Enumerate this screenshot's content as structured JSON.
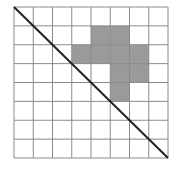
{
  "grid": {
    "rows": 8,
    "cols": 8,
    "left": 14,
    "top": 7,
    "width": 154,
    "height": 151,
    "line_color": "#8a8a8a",
    "shade_color": "#9a9a9a",
    "shaded_cells": [
      {
        "row": 1,
        "col": 4
      },
      {
        "row": 1,
        "col": 5
      },
      {
        "row": 2,
        "col": 3
      },
      {
        "row": 2,
        "col": 4
      },
      {
        "row": 2,
        "col": 5
      },
      {
        "row": 2,
        "col": 6
      },
      {
        "row": 3,
        "col": 5
      },
      {
        "row": 3,
        "col": 6
      },
      {
        "row": 4,
        "col": 5
      }
    ]
  },
  "diagonal": {
    "from": "top-left",
    "to": "bottom-right",
    "color": "#222222",
    "width": 2
  }
}
